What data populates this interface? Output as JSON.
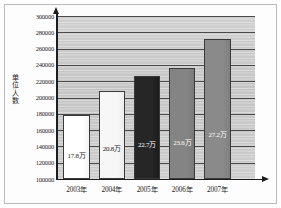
{
  "chart_data": {
    "type": "bar",
    "title": "",
    "subtitle": "",
    "xlabel": "",
    "ylabel": "单位:人数",
    "categories": [
      "2003年",
      "2004年",
      "2005年",
      "2006年",
      "2007年"
    ],
    "values": [
      178000,
      208000,
      227000,
      236000,
      272000
    ],
    "data_labels": [
      "17.8万",
      "20.8万",
      "22.7万",
      "23.6万",
      "27.2万"
    ],
    "bar_colors": [
      "#ffffff",
      "#f7f7f7",
      "#262626",
      "#848484",
      "#8a8a8a"
    ],
    "bar_label_colors": [
      "#1a1a1a",
      "#1a1a1a",
      "#ffffff",
      "#ffffff",
      "#ffffff"
    ],
    "ylim": [
      100000,
      300000
    ],
    "ytick_step": 20000,
    "yticks": [
      300000,
      280000,
      260000,
      240000,
      220000,
      200000,
      180000,
      160000,
      140000,
      120000,
      100000
    ],
    "ytick_labels": [
      "300000",
      "280000",
      "260000",
      "240000",
      "220000",
      "200000",
      "180000",
      "160000",
      "140000",
      "120000",
      "100000"
    ],
    "grid": true,
    "legend": false,
    "legend_position": "none",
    "plot_background": "#c3c3c3",
    "gridline_color": "#4a4a4a",
    "axis_color": "#1d1d1d",
    "frame_color": "#b9b9b9"
  }
}
